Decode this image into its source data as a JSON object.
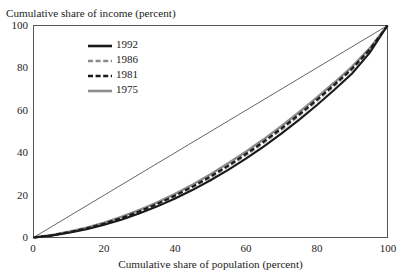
{
  "chart_data": {
    "type": "line",
    "title": "",
    "ylabel": "Cumulative share of income (percent)",
    "xlabel": "Cumulative share of population (percent)",
    "xlim": [
      0,
      100
    ],
    "ylim": [
      0,
      100
    ],
    "xticks": [
      "0",
      "20",
      "40",
      "60",
      "80",
      "100"
    ],
    "yticks": [
      "0",
      "20",
      "40",
      "60",
      "80",
      "100"
    ],
    "xtick_values": [
      0,
      20,
      40,
      60,
      80,
      100
    ],
    "ytick_values": [
      0,
      20,
      40,
      60,
      80,
      100
    ],
    "grid": false,
    "legend_position": "upper-left-inside",
    "x": [
      0,
      5,
      10,
      15,
      20,
      25,
      30,
      35,
      40,
      45,
      50,
      55,
      60,
      65,
      70,
      75,
      80,
      85,
      90,
      95,
      100
    ],
    "series": [
      {
        "name": "1992",
        "style": "solid",
        "color": "#1a1a1a",
        "width": 2.1,
        "values": [
          0,
          0.9,
          2.2,
          3.9,
          6.0,
          8.5,
          11.4,
          14.7,
          18.4,
          22.5,
          27.0,
          31.9,
          37.2,
          42.9,
          49.0,
          55.5,
          62.4,
          69.7,
          77.4,
          87.2,
          100
        ]
      },
      {
        "name": "1986",
        "style": "dashed",
        "color": "#8c8c8c",
        "width": 2.1,
        "values": [
          0,
          1.0,
          2.4,
          4.2,
          6.4,
          9.1,
          12.1,
          15.6,
          19.4,
          23.7,
          28.3,
          33.4,
          38.8,
          44.6,
          50.8,
          57.4,
          64.3,
          71.6,
          79.2,
          88.4,
          100
        ]
      },
      {
        "name": "1981",
        "style": "dashed",
        "color": "#1a1a1a",
        "width": 2.1,
        "values": [
          0,
          1.0,
          2.5,
          4.3,
          6.6,
          9.3,
          12.4,
          15.9,
          19.8,
          24.1,
          28.8,
          33.9,
          39.4,
          45.2,
          51.4,
          58.0,
          64.9,
          72.1,
          79.7,
          88.7,
          100
        ]
      },
      {
        "name": "1975",
        "style": "solid",
        "color": "#8c8c8c",
        "width": 2.4,
        "values": [
          0,
          1.1,
          2.7,
          4.6,
          7.0,
          9.8,
          13.0,
          16.6,
          20.6,
          25.0,
          29.8,
          35.0,
          40.5,
          46.3,
          52.5,
          59.1,
          66.0,
          73.1,
          80.6,
          89.3,
          100
        ]
      }
    ],
    "reference_line": {
      "name": "line-of-equality",
      "style": "solid-thin",
      "color": "#3d3d3d",
      "width": 0.8,
      "from": [
        0,
        0
      ],
      "to": [
        100,
        100
      ]
    },
    "annotations": []
  },
  "legend": {
    "items": [
      {
        "label": "1992",
        "style": "solid",
        "color": "#1a1a1a"
      },
      {
        "label": "1986",
        "style": "dashed",
        "color": "#8c8c8c"
      },
      {
        "label": "1981",
        "style": "dashed",
        "color": "#1a1a1a"
      },
      {
        "label": "1975",
        "style": "solid",
        "color": "#8c8c8c"
      }
    ]
  },
  "axes": {
    "frame_color": "#555555"
  }
}
